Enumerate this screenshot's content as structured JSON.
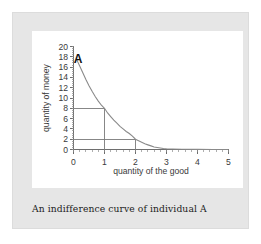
{
  "caption": {
    "text": "An indifference curve of individual A"
  },
  "chart_data": {
    "type": "line",
    "title": "",
    "subtitle": "",
    "xlabel": "quantity of the good",
    "ylabel": "quantity of money",
    "xlim": [
      0,
      5
    ],
    "ylim": [
      0,
      20
    ],
    "grid": false,
    "legend": null,
    "x_ticks": [
      "0",
      "1",
      "2",
      "3",
      "4",
      "5"
    ],
    "x_tick_values": [
      0,
      1,
      2,
      3,
      4,
      5
    ],
    "x_minor_per_major": 5,
    "y_ticks": [
      "0",
      "2",
      "4",
      "6",
      "8",
      "10",
      "12",
      "14",
      "16",
      "18",
      "20"
    ],
    "y_tick_values": [
      0,
      2,
      4,
      6,
      8,
      10,
      12,
      14,
      16,
      18,
      20
    ],
    "y_minor_per_major": 4,
    "series": [
      {
        "name": "indifference curve",
        "color": "#8a8a8a",
        "x": [
          0.1,
          0.2,
          0.3,
          0.4,
          0.5,
          0.6,
          0.7,
          0.8,
          0.9,
          1.0,
          1.1,
          1.2,
          1.3,
          1.4,
          1.5,
          1.6,
          1.7,
          1.8,
          1.9,
          2.0,
          2.1,
          2.2,
          2.3,
          2.4,
          2.5,
          2.6,
          2.7,
          2.8,
          2.9,
          3.0,
          3.2,
          3.5,
          4.0,
          4.5,
          5.0
        ],
        "y": [
          17.5,
          16.2,
          14.9,
          13.6,
          12.4,
          11.3,
          10.3,
          9.4,
          8.6,
          8.0,
          7.1,
          6.4,
          5.7,
          5.1,
          4.5,
          4.0,
          3.5,
          3.1,
          2.6,
          2.0,
          1.7,
          1.4,
          1.1,
          0.9,
          0.7,
          0.5,
          0.4,
          0.3,
          0.2,
          0.15,
          0.1,
          0.05,
          0.02,
          0.01,
          0.0
        ]
      }
    ],
    "annotations": [
      {
        "name": "curve-endpoint-label",
        "text": "A",
        "x": 0.15,
        "y": 17.6,
        "bold": true
      }
    ],
    "guide_lines": [
      {
        "name": "guide-rect-point-1",
        "point_x": 1,
        "point_y": 8,
        "description": "horizontal from y-axis to (1,8) and vertical down to x-axis"
      },
      {
        "name": "guide-rect-point-2",
        "point_x": 2,
        "point_y": 2,
        "description": "horizontal from y-axis to (2,2) and vertical down to x-axis"
      }
    ],
    "marked_points": [
      {
        "x": 1,
        "y": 8
      },
      {
        "x": 2,
        "y": 2
      }
    ]
  },
  "colors": {
    "frame": "#e6e6e6",
    "card": "#ffffff",
    "axis": "#6e6e6e",
    "curve": "#8a8a8a",
    "guide": "#7a7a7a",
    "text": "#3a3a3a"
  }
}
